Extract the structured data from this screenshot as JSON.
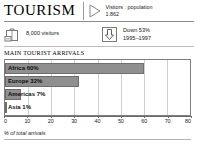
{
  "header": {
    "title": "TOURISM",
    "triangle_icon": "triangle-right-icon",
    "ratio_label": "Visitors : population",
    "ratio_value": "1:862"
  },
  "stats": [
    {
      "icon": "suitcase-icon",
      "line1": "8,000 visitors",
      "line2": ""
    },
    {
      "icon": "down-arrow-icon",
      "line1": "Down 53%",
      "line2": "1995–1997"
    }
  ],
  "chart_data": {
    "type": "bar",
    "orientation": "horizontal",
    "title": "MAIN TOURIST ARRIVALS",
    "categories": [
      "Africa",
      "Europe",
      "Americas",
      "Asia"
    ],
    "values": [
      60,
      32,
      7,
      1
    ],
    "bar_labels": [
      "Africa 60%",
      "Europe 32%",
      "Americas 7%",
      "Asia 1%"
    ],
    "xlabel": "% of total arrivals",
    "ylabel": "",
    "xlim": [
      0,
      80
    ],
    "xticks": [
      0,
      10,
      20,
      30,
      40,
      50,
      60,
      70,
      80
    ],
    "xtick_labels": [
      "0",
      "10",
      "20",
      "30",
      "40",
      "50",
      "60",
      "70",
      "80"
    ],
    "grid": true,
    "legend": "none",
    "bar_color": "#8f8f8f",
    "bar_border_color": "#6e6e6e",
    "grid_color": "#cfcfcf"
  }
}
